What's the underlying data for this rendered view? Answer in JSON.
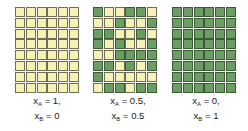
{
  "colors": {
    "A": "#f6f1b4",
    "B": "#6a9e62"
  },
  "panels": [
    {
      "id": "pure-A",
      "label": {
        "xA_var": "x",
        "xA_sub": "A",
        "xA_val": " = 1,",
        "xB_var": "x",
        "xB_sub": "B",
        "xB_val": " = 0"
      },
      "grid": [
        "AAAAAA",
        "AAAAAA",
        "AAAAAA",
        "AAAAAA",
        "AAAAAA",
        "AAAAAA",
        "AAAAAA",
        "AAAAAA"
      ]
    },
    {
      "id": "mixed",
      "label": {
        "xA_var": "x",
        "xA_sub": "A",
        "xA_val": " = 0.5,",
        "xB_var": "x",
        "xB_sub": "B",
        "xB_val": " = 0.5"
      },
      "grid": [
        "BAABBA",
        "AABAAB",
        "BBAABA",
        "BABAAB",
        "AABBBB",
        "BBABAB",
        "BAAAAA",
        "ABBABB"
      ]
    },
    {
      "id": "pure-B",
      "label": {
        "xA_var": "x",
        "xA_sub": "A",
        "xA_val": " = 0,",
        "xB_var": "x",
        "xB_sub": "B",
        "xB_val": " = 1"
      },
      "grid": [
        "BBBBBB",
        "BBBBBB",
        "BBBBBB",
        "BBBBBB",
        "BBBBBB",
        "BBBBBB",
        "BBBBBB",
        "BBBBBB"
      ]
    }
  ]
}
